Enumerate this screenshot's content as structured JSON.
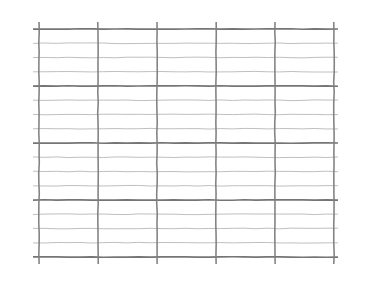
{
  "page": {
    "width": 374,
    "height": 290,
    "background_color": "#ffffff"
  },
  "chart_data": {
    "type": "table",
    "title": "",
    "subtitle": "",
    "xlabel": "",
    "ylabel": "",
    "grid": true,
    "legend": false,
    "legend_position": "none",
    "annotations": [],
    "tick_labels": {
      "x": [],
      "y": []
    },
    "series": [],
    "values": [],
    "categories": [],
    "plot_area": {
      "left": 39,
      "right": 334,
      "top": 29,
      "bottom": 257,
      "width": 295,
      "height": 228
    },
    "xlim": [
      39,
      334
    ],
    "ylim": [
      29,
      257
    ],
    "vertical_lines": {
      "count": 6,
      "positions": [
        39,
        98.0,
        157.0,
        216.0,
        275.0,
        334
      ],
      "spacing": 59.0,
      "color": "#7d7d7d",
      "width": 1.6,
      "style": "solid"
    },
    "horizontal_lines": {
      "count": 17,
      "positions": [
        29,
        43.25,
        57.5,
        71.75,
        86,
        100.25,
        114.5,
        128.75,
        143,
        157.25,
        171.5,
        185.75,
        200,
        214.25,
        228.5,
        242.75,
        257
      ],
      "spacing": 14.25,
      "minor_color": "#a8a8a8",
      "minor_width": 0.9,
      "major_color": "#6e6e6e",
      "major_width": 1.7,
      "major_every": 4,
      "major_positions": [
        29,
        86,
        143,
        200,
        257
      ],
      "style": "solid"
    },
    "cells": {
      "columns": 5,
      "rows": 16,
      "major_rows": 4,
      "cell_width": 59.0,
      "cell_height": 14.25
    }
  }
}
